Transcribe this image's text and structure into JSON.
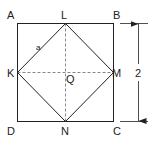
{
  "diagram": {
    "title": "",
    "square_vertices": {
      "top_left": "A",
      "top_right": "B",
      "bottom_right": "C",
      "bottom_left": "D"
    },
    "midpoints": {
      "top": "L",
      "right": "M",
      "bottom": "N",
      "left": "K"
    },
    "center": "Q",
    "inner_side_label": "a",
    "dimension_label": "2",
    "colors": {
      "stroke": "#222222",
      "dashed": "#777777",
      "background": "#ffffff"
    }
  }
}
